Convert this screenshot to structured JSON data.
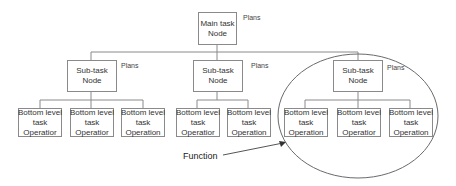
{
  "diagram": {
    "root": {
      "lines": [
        "Main task",
        "Node"
      ],
      "annotation": "Plans"
    },
    "subtasks": [
      {
        "lines": [
          "Sub-task",
          "Node"
        ],
        "annotation": "Plans",
        "children": [
          {
            "lines": [
              "Bottom level",
              "task",
              "Operatior"
            ]
          },
          {
            "lines": [
              "Bottom level",
              "task",
              "Operatior"
            ]
          },
          {
            "lines": [
              "Bottom level",
              "task",
              "Operation"
            ]
          }
        ]
      },
      {
        "lines": [
          "Sub-task",
          "Node"
        ],
        "annotation": "Plans",
        "children": [
          {
            "lines": [
              "Bottom level",
              "task",
              "Operatior"
            ]
          },
          {
            "lines": [
              "Bottom level",
              "task",
              "Operation"
            ]
          }
        ]
      },
      {
        "lines": [
          "Sub-task",
          "Node"
        ],
        "annotation": "Plans",
        "children": [
          {
            "lines": [
              "Bottom level",
              "task",
              "Operation"
            ]
          },
          {
            "lines": [
              "Bottom level",
              "task",
              "Operatior"
            ]
          },
          {
            "lines": [
              "Bottom level",
              "task",
              "Operation"
            ]
          }
        ]
      }
    ],
    "callout": {
      "label": "Function",
      "target": "third sub-task group (ellipse)"
    },
    "colors": {
      "line": "#8a8a8a",
      "text": "#333333",
      "background": "#ffffff"
    }
  }
}
